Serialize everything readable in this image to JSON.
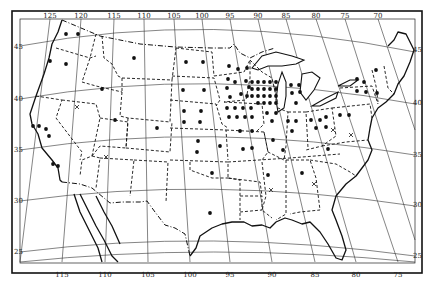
{
  "map": {
    "title": "United States distribution map",
    "longitude_labels_top": [
      {
        "label": "125",
        "x": 50,
        "y": 18
      },
      {
        "label": "120",
        "x": 81,
        "y": 18
      },
      {
        "label": "115",
        "x": 114,
        "y": 18
      },
      {
        "label": "110",
        "x": 144,
        "y": 18
      },
      {
        "label": "105",
        "x": 174,
        "y": 18
      },
      {
        "label": "100",
        "x": 202,
        "y": 18
      },
      {
        "label": "95",
        "x": 230,
        "y": 18
      },
      {
        "label": "90",
        "x": 258,
        "y": 18
      },
      {
        "label": "85",
        "x": 286,
        "y": 18
      },
      {
        "label": "80",
        "x": 316,
        "y": 18
      },
      {
        "label": "75",
        "x": 345,
        "y": 18
      },
      {
        "label": "70",
        "x": 378,
        "y": 18
      }
    ],
    "longitude_labels_bottom": [
      {
        "label": "115",
        "x": 62,
        "y": 277
      },
      {
        "label": "110",
        "x": 105,
        "y": 277
      },
      {
        "label": "105",
        "x": 148,
        "y": 277
      },
      {
        "label": "100",
        "x": 190,
        "y": 277
      },
      {
        "label": "95",
        "x": 230,
        "y": 277
      },
      {
        "label": "90",
        "x": 272,
        "y": 277
      },
      {
        "label": "85",
        "x": 315,
        "y": 277
      },
      {
        "label": "80",
        "x": 356,
        "y": 277
      },
      {
        "label": "75",
        "x": 398,
        "y": 277
      }
    ],
    "latitude_labels_left": [
      {
        "label": "45",
        "x": 14,
        "y": 49
      },
      {
        "label": "40",
        "x": 14,
        "y": 101
      },
      {
        "label": "35",
        "x": 14,
        "y": 152
      },
      {
        "label": "30",
        "x": 14,
        "y": 203
      },
      {
        "label": "25",
        "x": 14,
        "y": 254
      }
    ],
    "latitude_labels_right": [
      {
        "label": "45",
        "x": 413,
        "y": 52
      },
      {
        "label": "40",
        "x": 413,
        "y": 105
      },
      {
        "label": "35",
        "x": 413,
        "y": 157
      },
      {
        "label": "30",
        "x": 413,
        "y": 207
      },
      {
        "label": "25",
        "x": 413,
        "y": 258
      }
    ],
    "legend_symbols": {
      "dot": "present",
      "cross": "x-mark"
    },
    "dots": [
      [
        66,
        34
      ],
      [
        78,
        34
      ],
      [
        50,
        61
      ],
      [
        66,
        64
      ],
      [
        102,
        89
      ],
      [
        134,
        58
      ],
      [
        186,
        62
      ],
      [
        203,
        62
      ],
      [
        183,
        90
      ],
      [
        204,
        90
      ],
      [
        184,
        111
      ],
      [
        201,
        111
      ],
      [
        184,
        122
      ],
      [
        200,
        122
      ],
      [
        198,
        141
      ],
      [
        220,
        146
      ],
      [
        197,
        152
      ],
      [
        212,
        173
      ],
      [
        210,
        213
      ],
      [
        33,
        126
      ],
      [
        39,
        126
      ],
      [
        46,
        129
      ],
      [
        49,
        136
      ],
      [
        53,
        164
      ],
      [
        58,
        166
      ],
      [
        115,
        120
      ],
      [
        157,
        128
      ],
      [
        229,
        66
      ],
      [
        238,
        69
      ],
      [
        247,
        68
      ],
      [
        228,
        79
      ],
      [
        235,
        82
      ],
      [
        246,
        81
      ],
      [
        249,
        87
      ],
      [
        227,
        88
      ],
      [
        241,
        94
      ],
      [
        247,
        96
      ],
      [
        230,
        97
      ],
      [
        252,
        82
      ],
      [
        258,
        82
      ],
      [
        264,
        82
      ],
      [
        270,
        82
      ],
      [
        276,
        82
      ],
      [
        252,
        89
      ],
      [
        258,
        89
      ],
      [
        264,
        89
      ],
      [
        270,
        89
      ],
      [
        276,
        89
      ],
      [
        252,
        96
      ],
      [
        258,
        96
      ],
      [
        264,
        96
      ],
      [
        270,
        96
      ],
      [
        276,
        96
      ],
      [
        258,
        103
      ],
      [
        264,
        103
      ],
      [
        270,
        103
      ],
      [
        276,
        103
      ],
      [
        227,
        108
      ],
      [
        235,
        108
      ],
      [
        243,
        108
      ],
      [
        251,
        108
      ],
      [
        229,
        117
      ],
      [
        237,
        117
      ],
      [
        245,
        117
      ],
      [
        252,
        117
      ],
      [
        240,
        131
      ],
      [
        252,
        131
      ],
      [
        243,
        149
      ],
      [
        252,
        148
      ],
      [
        267,
        113
      ],
      [
        276,
        113
      ],
      [
        272,
        121
      ],
      [
        273,
        140
      ],
      [
        291,
        85
      ],
      [
        299,
        85
      ],
      [
        292,
        93
      ],
      [
        300,
        92
      ],
      [
        296,
        103
      ],
      [
        288,
        121
      ],
      [
        296,
        121
      ],
      [
        292,
        131
      ],
      [
        311,
        120
      ],
      [
        320,
        120
      ],
      [
        326,
        117
      ],
      [
        316,
        128
      ],
      [
        326,
        127
      ],
      [
        340,
        115
      ],
      [
        349,
        115
      ],
      [
        357,
        79
      ],
      [
        364,
        82
      ],
      [
        357,
        91
      ],
      [
        366,
        92
      ],
      [
        377,
        93
      ],
      [
        376,
        70
      ],
      [
        328,
        149
      ],
      [
        283,
        150
      ],
      [
        268,
        175
      ],
      [
        302,
        173
      ]
    ],
    "crosses": [
      [
        77,
        107
      ],
      [
        106,
        157
      ],
      [
        271,
        190
      ],
      [
        314,
        184
      ],
      [
        333,
        130
      ],
      [
        351,
        135
      ]
    ]
  }
}
